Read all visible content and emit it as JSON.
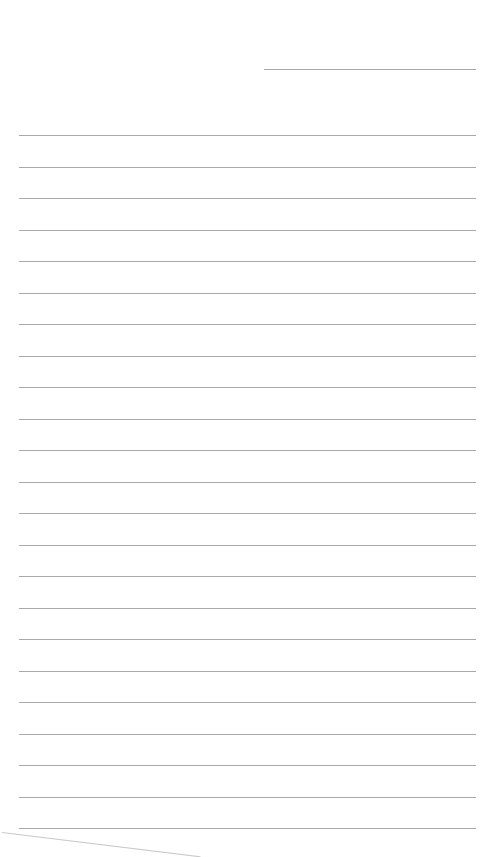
{
  "page": {
    "type": "lined-paper",
    "header_line": {
      "present": true
    },
    "rule_count": 23,
    "rule_color": "#a9a9a9",
    "background": "#ffffff",
    "text": ""
  }
}
